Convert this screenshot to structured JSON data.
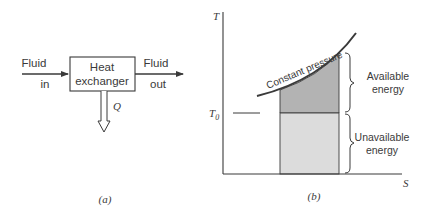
{
  "panel_a": {
    "caption": "(a)",
    "box_label_line1": "Heat",
    "box_label_line2": "exchanger",
    "input_label_line1": "Fluid",
    "input_label_line2": "in",
    "output_label_line1": "Fluid",
    "output_label_line2": "out",
    "heat_label": "Q"
  },
  "panel_b": {
    "caption": "(b)",
    "y_axis_label": "T",
    "x_axis_label": "S",
    "t0_label": "T",
    "t0_subscript": "0",
    "curve_label": "Constant pressure",
    "available_line1": "Available",
    "available_line2": "energy",
    "unavailable_line1": "Unavailable",
    "unavailable_line2": "energy"
  },
  "colors": {
    "line": "#3a3a3a",
    "available_fill": "#b3b3b3",
    "unavailable_fill": "#dcdcdc"
  }
}
